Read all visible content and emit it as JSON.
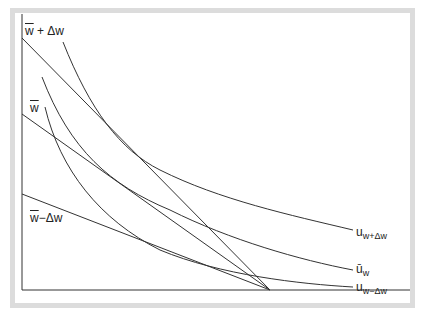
{
  "diagram": {
    "type": "indifference-curves-budget-lines",
    "colors": {
      "line": "#333333",
      "frame": "#dcdcdc",
      "background": "#ffffff"
    },
    "left_labels": [
      {
        "id": "w_plus",
        "base": "w",
        "rest": " + Δw"
      },
      {
        "id": "w_bar",
        "base": "w",
        "rest": ""
      },
      {
        "id": "w_minus",
        "base": "w",
        "rest": "−Δw"
      }
    ],
    "right_labels": [
      {
        "id": "u_plus",
        "base": "u",
        "sub": "w+Δw"
      },
      {
        "id": "u_bar",
        "base": "ū",
        "sub": "w"
      },
      {
        "id": "u_minus",
        "base": "u",
        "sub": "w−Δw"
      }
    ]
  }
}
